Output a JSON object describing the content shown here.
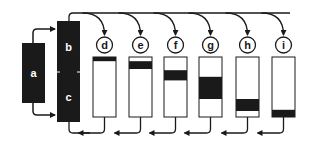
{
  "colors": {
    "ink": "#1a1a1a",
    "paper": "#ffffff"
  },
  "blocks": [
    {
      "id": "a",
      "label": "a",
      "x": 22,
      "y": 43,
      "w": 23,
      "h": 60
    },
    {
      "id": "b",
      "label": "b",
      "x": 57,
      "y": 21,
      "w": 23,
      "h": 51
    },
    {
      "id": "c",
      "label": "c",
      "x": 57,
      "y": 72,
      "w": 23,
      "h": 50
    }
  ],
  "tubes": [
    {
      "id": "d",
      "label": "d",
      "x": 93,
      "band_top": 0.0,
      "band_h": 0.07
    },
    {
      "id": "e",
      "label": "e",
      "x": 129,
      "band_top": 0.07,
      "band_h": 0.13
    },
    {
      "id": "f",
      "label": "f",
      "x": 164,
      "band_top": 0.22,
      "band_h": 0.17
    },
    {
      "id": "g",
      "label": "g",
      "x": 199,
      "band_top": 0.33,
      "band_h": 0.37
    },
    {
      "id": "h",
      "label": "h",
      "x": 236,
      "band_top": 0.7,
      "band_h": 0.2
    },
    {
      "id": "i",
      "label": "i",
      "x": 272,
      "band_top": 0.88,
      "band_h": 0.12
    }
  ],
  "tube_geom": {
    "y": 57,
    "w": 23,
    "h": 60,
    "circle_y": 45,
    "circle_r": 8
  },
  "flow": {
    "top_y": 13,
    "bottom_y": 133
  }
}
